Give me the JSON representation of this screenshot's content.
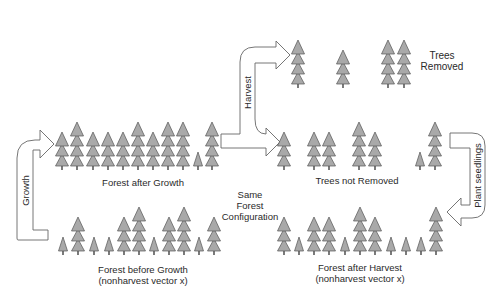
{
  "diagram": {
    "title": "",
    "colors": {
      "tree_fill": "#a9a9a9",
      "tree_stroke": "#555555",
      "trunk": "#333333",
      "arrow_stroke": "#666666",
      "arrow_fill": "#ffffff",
      "text": "#2a2a2a"
    },
    "labels": {
      "forest_after_growth": "Forest after Growth",
      "forest_before_growth_line1": "Forest before Growth",
      "forest_before_growth_line2": "(nonharvest vector x)",
      "trees_removed_line1": "Trees",
      "trees_removed_line2": "Removed",
      "trees_not_removed": "Trees not Removed",
      "same_config_line1": "Same",
      "same_config_line2": "Forest",
      "same_config_line3": "Configuration",
      "forest_after_harvest_line1": "Forest after Harvest",
      "forest_after_harvest_line2": "(nonharvest vector x)"
    },
    "arrows": [
      {
        "id": "growth",
        "label": "Growth"
      },
      {
        "id": "harvest",
        "label": "Harvest"
      },
      {
        "id": "plant_seedlings",
        "label": "Plant seedlings"
      }
    ],
    "tree_rows": [
      {
        "id": "forest_after_growth",
        "ground_y": 170,
        "trees": [
          [
            62,
            3
          ],
          [
            77,
            4
          ],
          [
            93,
            3
          ],
          [
            108,
            3
          ],
          [
            123,
            3
          ],
          [
            138,
            4
          ],
          [
            153,
            3
          ],
          [
            168,
            4
          ],
          [
            183,
            4
          ],
          [
            198,
            1
          ],
          [
            212,
            4
          ]
        ]
      },
      {
        "id": "forest_before_growth",
        "ground_y": 255,
        "trees": [
          [
            63,
            1
          ],
          [
            78,
            3
          ],
          [
            94,
            1
          ],
          [
            109,
            1
          ],
          [
            124,
            3
          ],
          [
            139,
            4
          ],
          [
            154,
            1
          ],
          [
            169,
            3
          ],
          [
            184,
            4
          ],
          [
            199,
            1
          ],
          [
            214,
            3
          ]
        ]
      },
      {
        "id": "trees_removed",
        "ground_y": 88,
        "trees": [
          [
            298,
            4
          ],
          [
            343,
            3
          ],
          [
            388,
            4
          ],
          [
            404,
            4
          ]
        ]
      },
      {
        "id": "trees_not_removed",
        "ground_y": 170,
        "trees": [
          [
            284,
            3
          ],
          [
            314,
            3
          ],
          [
            329,
            3
          ],
          [
            359,
            4
          ],
          [
            375,
            3
          ],
          [
            420,
            1
          ],
          [
            435,
            4
          ]
        ]
      },
      {
        "id": "forest_after_harvest",
        "ground_y": 255,
        "trees": [
          [
            284,
            3
          ],
          [
            299,
            1
          ],
          [
            314,
            3
          ],
          [
            329,
            3
          ],
          [
            345,
            1
          ],
          [
            360,
            4
          ],
          [
            375,
            3
          ],
          [
            391,
            1
          ],
          [
            406,
            1
          ],
          [
            421,
            1
          ],
          [
            436,
            4
          ]
        ]
      }
    ]
  }
}
